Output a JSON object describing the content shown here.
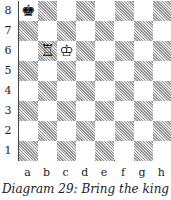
{
  "diagram": {
    "caption": "Diagram 29: Bring the king",
    "ranks": [
      "8",
      "7",
      "6",
      "5",
      "4",
      "3",
      "2",
      "1"
    ],
    "files": [
      "a",
      "b",
      "c",
      "d",
      "e",
      "f",
      "g",
      "h"
    ],
    "pieces": [
      {
        "square": "a8",
        "piece": "black-king",
        "glyph": "♚"
      },
      {
        "square": "b6",
        "piece": "white-rook",
        "glyph": "♖"
      },
      {
        "square": "c6",
        "piece": "white-king",
        "glyph": "♔"
      }
    ]
  }
}
